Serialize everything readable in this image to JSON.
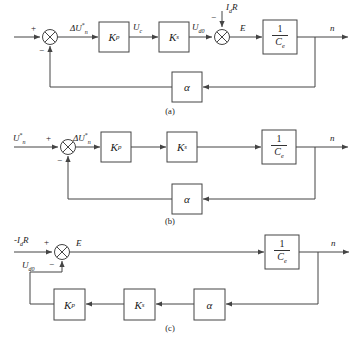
{
  "figure": {
    "line_color": "#444444",
    "text_color": "#1a1a1a",
    "background": "#ffffff"
  },
  "symbols": {
    "delta_u_ref": "ΔU*n",
    "u_ref": "U*n",
    "u_c": "Uc",
    "u_d0": "Ud0",
    "neg_id_r": "-IdR",
    "id_r": "IdR",
    "emf": "E",
    "speed": "n",
    "plus": "+",
    "minus": "−"
  },
  "blocks": {
    "kp": {
      "label": "Kp",
      "base": "K",
      "sub": "p"
    },
    "ks": {
      "label": "Ks",
      "base": "K",
      "sub": "s"
    },
    "alpha": {
      "label": "α"
    },
    "one_over_ce": {
      "label": "1/Ce",
      "numerator": "1",
      "denominator": "Ce",
      "den_base": "C",
      "den_sub": "e"
    }
  },
  "diagrams": [
    {
      "id": "a",
      "caption": "(a)",
      "summing_nodes": [
        {
          "name": "error-junction",
          "signs": [
            "+",
            "−"
          ]
        },
        {
          "name": "emf-junction",
          "signs": [
            "−"
          ]
        }
      ],
      "signals": [
        {
          "name": "input-plus",
          "text": "+"
        },
        {
          "name": "feedback-minus",
          "text": "−"
        },
        {
          "name": "error-signal",
          "base": "ΔU",
          "sup": "*",
          "sub": "n"
        },
        {
          "name": "control-voltage",
          "base": "U",
          "sub": "c"
        },
        {
          "name": "converter-output",
          "base": "U",
          "sub": "d0"
        },
        {
          "name": "disturbance-minus",
          "text": "−"
        },
        {
          "name": "disturbance",
          "base": "I",
          "sub": "d",
          "tail": "R"
        },
        {
          "name": "back-emf",
          "text": "E"
        },
        {
          "name": "output-speed",
          "text": "n"
        }
      ],
      "forward_blocks": [
        "Kp",
        "Ks",
        "1/Ce"
      ],
      "feedback_blocks": [
        "α"
      ]
    },
    {
      "id": "b",
      "caption": "(b)",
      "summing_nodes": [
        {
          "name": "error-junction",
          "signs": [
            "+",
            "−"
          ]
        }
      ],
      "signals": [
        {
          "name": "reference-input",
          "base": "U",
          "sup": "*",
          "sub": "n"
        },
        {
          "name": "input-plus",
          "text": "+"
        },
        {
          "name": "feedback-minus",
          "text": "−"
        },
        {
          "name": "error-signal",
          "base": "ΔU",
          "sup": "*",
          "sub": "n"
        },
        {
          "name": "output-speed",
          "text": "n"
        }
      ],
      "forward_blocks": [
        "Kp",
        "Ks",
        "1/Ce"
      ],
      "feedback_blocks": [
        "α"
      ]
    },
    {
      "id": "c",
      "caption": "(c)",
      "summing_nodes": [
        {
          "name": "emf-junction",
          "signs": [
            "+",
            "−"
          ]
        }
      ],
      "signals": [
        {
          "name": "disturbance-input",
          "prefix": "-",
          "base": "I",
          "sub": "d",
          "tail": "R"
        },
        {
          "name": "input-plus",
          "text": "+"
        },
        {
          "name": "feedback-signal",
          "base": "U",
          "sub": "d0"
        },
        {
          "name": "feedback-minus",
          "text": "−"
        },
        {
          "name": "back-emf",
          "text": "E"
        },
        {
          "name": "output-speed",
          "text": "n"
        }
      ],
      "forward_blocks": [
        "1/Ce"
      ],
      "feedback_blocks": [
        "α",
        "Ks",
        "Kp"
      ]
    }
  ]
}
